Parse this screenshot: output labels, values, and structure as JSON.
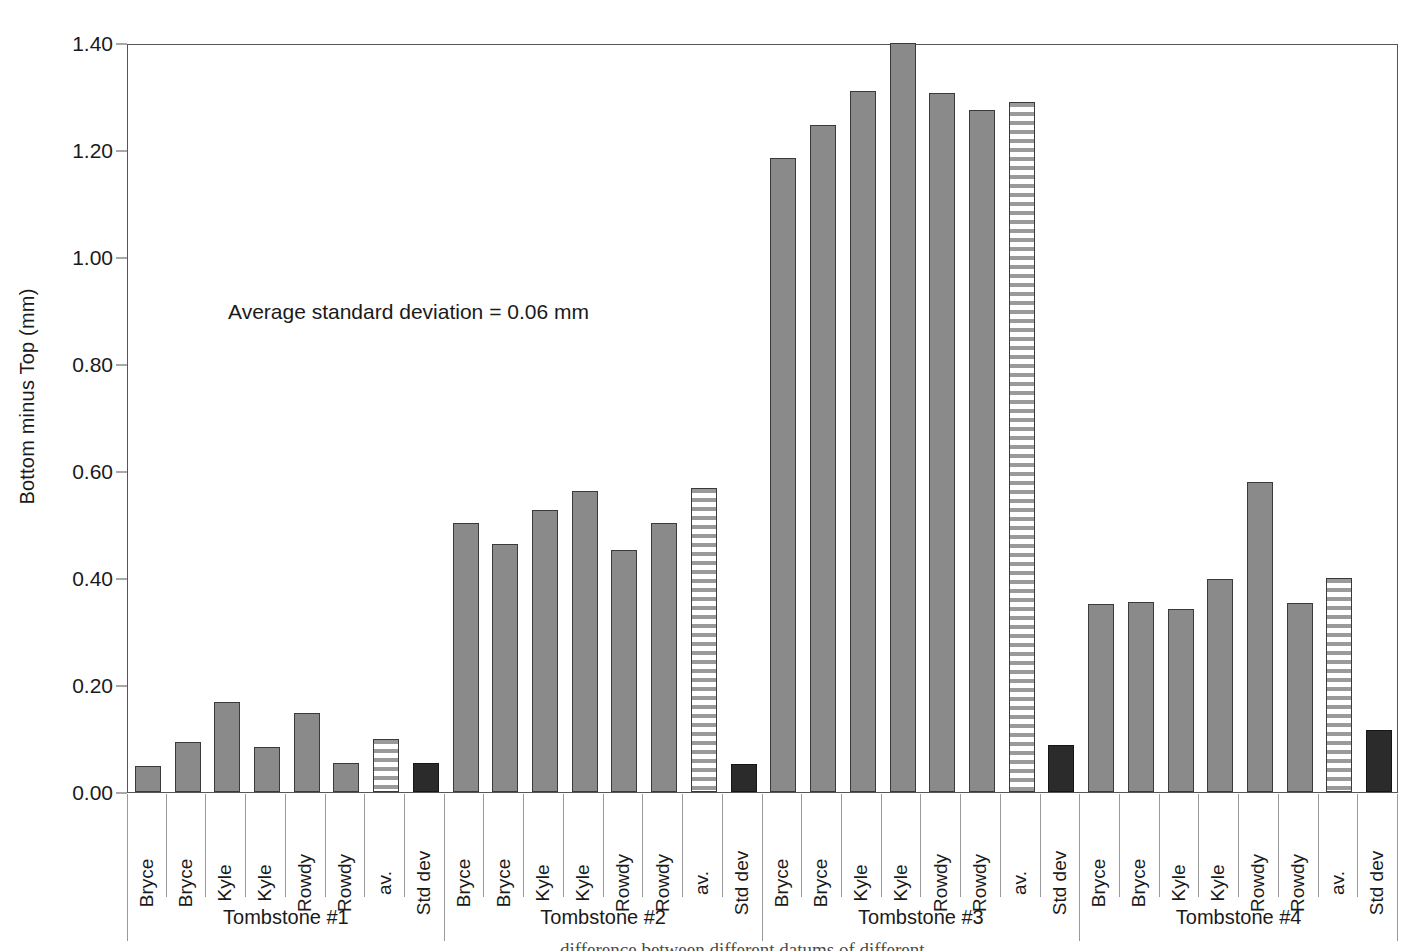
{
  "chart": {
    "type": "bar",
    "ylabel": "Bottom minus Top (mm)",
    "annotation": "Average standard deviation = 0.06 mm",
    "caption_clipped": "difference between different datums of different",
    "yticks": [
      "0.00",
      "0.20",
      "0.40",
      "0.60",
      "0.80",
      "1.00",
      "1.20",
      "1.40"
    ]
  },
  "chart_data": {
    "type": "bar",
    "title": "",
    "xlabel": "",
    "ylabel": "Bottom minus Top (mm)",
    "ylim": [
      0,
      1.4
    ],
    "ytick_values": [
      0.0,
      0.2,
      0.4,
      0.6,
      0.8,
      1.0,
      1.2,
      1.4
    ],
    "grid": false,
    "legend": "none",
    "annotations": [
      "Average standard deviation = 0.06 mm"
    ],
    "categories": [
      "Bryce",
      "Bryce",
      "Kyle",
      "Kyle",
      "Rowdy",
      "Rowdy",
      "av.",
      "Std dev"
    ],
    "groups": [
      {
        "name": "Tombstone #1",
        "bars": [
          {
            "label": "Bryce",
            "value": 0.048,
            "style": "solid"
          },
          {
            "label": "Bryce",
            "value": 0.094,
            "style": "solid"
          },
          {
            "label": "Kyle",
            "value": 0.168,
            "style": "solid"
          },
          {
            "label": "Kyle",
            "value": 0.085,
            "style": "solid"
          },
          {
            "label": "Rowdy",
            "value": 0.148,
            "style": "solid"
          },
          {
            "label": "Rowdy",
            "value": 0.055,
            "style": "solid"
          },
          {
            "label": "av.",
            "value": 0.1,
            "style": "striped"
          },
          {
            "label": "Std dev",
            "value": 0.055,
            "style": "dark"
          }
        ]
      },
      {
        "name": "Tombstone #2",
        "bars": [
          {
            "label": "Bryce",
            "value": 0.503,
            "style": "solid"
          },
          {
            "label": "Bryce",
            "value": 0.464,
            "style": "solid"
          },
          {
            "label": "Kyle",
            "value": 0.527,
            "style": "solid"
          },
          {
            "label": "Kyle",
            "value": 0.562,
            "style": "solid"
          },
          {
            "label": "Rowdy",
            "value": 0.453,
            "style": "solid"
          },
          {
            "label": "Rowdy",
            "value": 0.502,
            "style": "solid"
          },
          {
            "label": "av.",
            "value": 0.568,
            "style": "striped"
          },
          {
            "label": "Std dev",
            "value": 0.053,
            "style": "dark"
          }
        ]
      },
      {
        "name": "Tombstone #3",
        "bars": [
          {
            "label": "Bryce",
            "value": 1.186,
            "style": "solid"
          },
          {
            "label": "Bryce",
            "value": 1.246,
            "style": "solid"
          },
          {
            "label": "Kyle",
            "value": 1.31,
            "style": "solid"
          },
          {
            "label": "Kyle",
            "value": 1.4,
            "style": "solid"
          },
          {
            "label": "Rowdy",
            "value": 1.306,
            "style": "solid"
          },
          {
            "label": "Rowdy",
            "value": 1.275,
            "style": "solid"
          },
          {
            "label": "av.",
            "value": 1.29,
            "style": "striped"
          },
          {
            "label": "Std dev",
            "value": 0.088,
            "style": "dark"
          }
        ]
      },
      {
        "name": "Tombstone #4",
        "bars": [
          {
            "label": "Bryce",
            "value": 0.351,
            "style": "solid"
          },
          {
            "label": "Bryce",
            "value": 0.355,
            "style": "solid"
          },
          {
            "label": "Kyle",
            "value": 0.343,
            "style": "solid"
          },
          {
            "label": "Kyle",
            "value": 0.398,
            "style": "solid"
          },
          {
            "label": "Rowdy",
            "value": 0.58,
            "style": "solid"
          },
          {
            "label": "Rowdy",
            "value": 0.354,
            "style": "solid"
          },
          {
            "label": "av.",
            "value": 0.4,
            "style": "striped"
          },
          {
            "label": "Std dev",
            "value": 0.116,
            "style": "dark"
          }
        ]
      }
    ],
    "colors": {
      "bar_solid": "#8a8a8a",
      "bar_dark": "#2b2b2b",
      "bar_striped": "#9a9a9a",
      "axis": "#555555",
      "text": "#1a1a1a"
    }
  }
}
